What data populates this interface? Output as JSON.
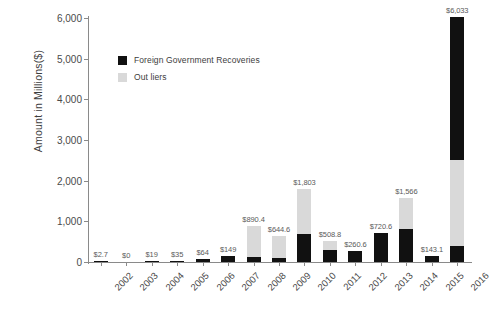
{
  "chart_data": {
    "type": "bar",
    "title": "",
    "xlabel": "",
    "ylabel": "Amount in Millions($)",
    "ylim": [
      0,
      6000
    ],
    "yticks": [
      "0",
      "1,000",
      "2,000",
      "3,000",
      "4,000",
      "5,000",
      "6,000"
    ],
    "ytick_values": [
      0,
      1000,
      2000,
      3000,
      4000,
      5000,
      6000
    ],
    "grid": false,
    "stacked": true,
    "legend_position": "upper-left-inside",
    "categories": [
      "2002",
      "2003",
      "2004",
      "2005",
      "2006",
      "2007",
      "2008",
      "2009",
      "2010",
      "2011",
      "2012",
      "2013",
      "2014",
      "2015",
      "2016"
    ],
    "series": [
      {
        "name": "Foreign Government Recoveries",
        "color": "#111111",
        "values": [
          2.7,
          0,
          19,
          35,
          64,
          149,
          120,
          95,
          700,
          300,
          260.6,
          720.6,
          800,
          143.1,
          400
        ]
      },
      {
        "name": "Out liers",
        "color": "#d9d9d9",
        "values": [
          0,
          0,
          0,
          0,
          0,
          0,
          770.4,
          549.6,
          1103,
          208.8,
          0,
          0,
          766,
          0,
          2100
        ]
      },
      {
        "name": "Foreign Government Recoveries (top)",
        "color": "#111111",
        "values": [
          0,
          0,
          0,
          0,
          0,
          0,
          0,
          0,
          0,
          0,
          0,
          0,
          0,
          0,
          3533
        ]
      }
    ],
    "totals": [
      2.7,
      0,
      19,
      35,
      64,
      149,
      890.4,
      644.6,
      1803,
      508.8,
      260.6,
      720.6,
      1566,
      143.1,
      6033
    ],
    "data_labels": [
      "$2.7",
      "$0",
      "$19",
      "$35",
      "$64",
      "$149",
      "$890.4",
      "$644.6",
      "$1,803",
      "$508.8",
      "$260.6",
      "$720.6",
      "$1,566",
      "$143.1",
      "$6,033"
    ],
    "legend": [
      {
        "label": "Foreign Government Recoveries",
        "color": "#111111"
      },
      {
        "label": "Out liers",
        "color": "#d9d9d9"
      }
    ]
  }
}
